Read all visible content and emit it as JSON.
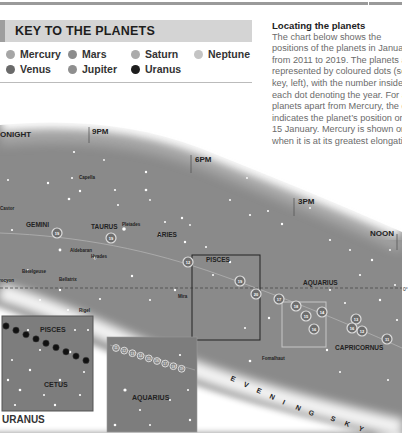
{
  "key": {
    "title": "KEY TO THE PLANETS",
    "planets": [
      {
        "name": "Mercury",
        "color": "#a6a6a6"
      },
      {
        "name": "Mars",
        "color": "#8c8c8c"
      },
      {
        "name": "Saturn",
        "color": "#ababab"
      },
      {
        "name": "Neptune",
        "color": "#c4c4c4"
      },
      {
        "name": "Venus",
        "color": "#6a6a6a"
      },
      {
        "name": "Jupiter",
        "color": "#8f8f8f"
      },
      {
        "name": "Uranus",
        "color": "#1e1e1e"
      }
    ]
  },
  "info": {
    "title": "Locating the planets",
    "body": "The chart below shows the positions of the planets in January from 2011 to 2019. The planets are represented by coloured dots (see key, left), with the number inside each dot denoting the year. For all planets apart from Mercury, the dot indicates the planet’s position on 15 January. Mercury is shown only when it is at its greatest elongation."
  },
  "chart": {
    "times": [
      "MIDNIGHT",
      "9PM",
      "6PM",
      "3PM",
      "NOON"
    ],
    "times_visible": [
      "ONIGHT",
      "9PM",
      "6PM",
      "3PM",
      "NOON"
    ],
    "equator_label": "0°",
    "constellations": [
      "GEMINI",
      "TAURUS",
      "ARIES",
      "PISCES",
      "AQUARIUS",
      "CAPRICORNUS"
    ],
    "stars": [
      "Capella",
      "Castor",
      "Pleiades",
      "Aldebaran",
      "Hyades",
      "Betelgeuse",
      "Bellatrix",
      "Procyon",
      "Rigel",
      "Mira",
      "Fomalhaut"
    ],
    "sky_label": "EVENING SKY",
    "planet_markers": [
      {
        "year": "19",
        "x": 57,
        "y": 233
      },
      {
        "year": "19",
        "x": 111,
        "y": 238
      },
      {
        "year": "12",
        "x": 188,
        "y": 262
      },
      {
        "year": "19",
        "x": 240,
        "y": 281
      },
      {
        "year": "20",
        "x": 256,
        "y": 294
      },
      {
        "year": "17",
        "x": 279,
        "y": 299
      },
      {
        "year": "18",
        "x": 296,
        "y": 306
      },
      {
        "year": "15",
        "x": 306,
        "y": 316
      },
      {
        "year": "14",
        "x": 322,
        "y": 312
      },
      {
        "year": "16",
        "x": 314,
        "y": 329
      },
      {
        "year": "13",
        "x": 356,
        "y": 319
      },
      {
        "year": "16",
        "x": 352,
        "y": 328
      },
      {
        "year": "12",
        "x": 362,
        "y": 331
      },
      {
        "year": "11",
        "x": 387,
        "y": 339
      }
    ]
  },
  "insets": {
    "uranus": {
      "caption": "URANUS",
      "labels": [
        "PISCES",
        "CETUS"
      ]
    },
    "neptune": {
      "labels": [
        "AQUARIUS"
      ],
      "years": [
        "11",
        "12",
        "13",
        "14",
        "15",
        "16",
        "17",
        "18",
        "19"
      ]
    }
  }
}
